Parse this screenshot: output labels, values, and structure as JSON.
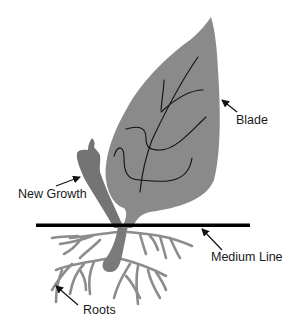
{
  "diagram": {
    "colors": {
      "background": "#ffffff",
      "blade": "#8a8a8a",
      "new_growth": "#747474",
      "roots": "#8c8c8c",
      "veins": "#111111",
      "medium_line": "#000000",
      "arrows": "#111111"
    },
    "labels": {
      "blade": "Blade",
      "new_growth": "New Growth",
      "medium_line": "Medium Line",
      "roots": "Roots"
    }
  }
}
